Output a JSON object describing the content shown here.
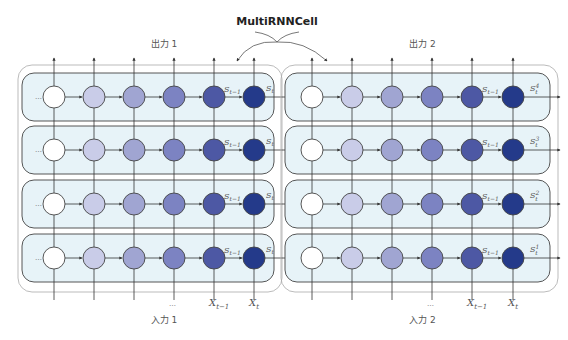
{
  "title": "MultiRNNCell",
  "groups": [
    {
      "id": "group-1",
      "output_label": "出力 1",
      "input_label": "入力 1",
      "row_state_in_label": "…",
      "state_label_prev": "S",
      "state_label_prev_sub": "t−1",
      "row_output_labels": [
        {
          "base": "S",
          "sub": "t",
          "sup": ""
        },
        {
          "base": "S",
          "sub": "t",
          "sup": ""
        },
        {
          "base": "S",
          "sub": "t",
          "sup": ""
        },
        {
          "base": "S",
          "sub": "t",
          "sup": ""
        }
      ],
      "input_labels": [
        {
          "base": "",
          "sub": ""
        },
        {
          "base": "",
          "sub": ""
        },
        {
          "base": "",
          "sub": ""
        },
        {
          "base": "…",
          "sub": ""
        },
        {
          "base": "X",
          "sub": "t−1"
        },
        {
          "base": "X",
          "sub": "t"
        }
      ]
    },
    {
      "id": "group-2",
      "output_label": "出力 2",
      "input_label": "入力 2",
      "row_state_in_label": "",
      "state_label_prev": "S",
      "state_label_prev_sub": "t−1",
      "row_output_labels": [
        {
          "base": "S",
          "sub": "t",
          "sup": "4"
        },
        {
          "base": "S",
          "sub": "t",
          "sup": "3"
        },
        {
          "base": "S",
          "sub": "t",
          "sup": "2"
        },
        {
          "base": "S",
          "sub": "t",
          "sup": "1"
        }
      ],
      "input_labels": [
        {
          "base": "",
          "sub": ""
        },
        {
          "base": "",
          "sub": ""
        },
        {
          "base": "",
          "sub": ""
        },
        {
          "base": "…",
          "sub": ""
        },
        {
          "base": "X",
          "sub": "t−1"
        },
        {
          "base": "X",
          "sub": "t"
        }
      ]
    }
  ],
  "layers_per_group": 4,
  "cells_per_row": 6,
  "cell_colors": [
    "#ffffff",
    "#c9cce8",
    "#a0a5d2",
    "#7c83c2",
    "#4d58a4",
    "#243a8a"
  ],
  "colors": {
    "box_fill": "#e7f3f8",
    "box_stroke": "#444444",
    "outer_stroke": "#aaaaaa",
    "line": "#333333",
    "circle_stroke": "#444444"
  }
}
